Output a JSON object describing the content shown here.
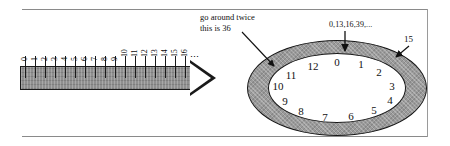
{
  "figure": {
    "number_line": {
      "ticks": [
        "0",
        "1",
        "2",
        "3",
        "4",
        "5",
        "6",
        "7",
        "8",
        "9",
        "10",
        "11",
        "12",
        "13",
        "14",
        "15",
        "16"
      ],
      "continuation": "⋮",
      "arrow_direction": "right"
    },
    "clock": {
      "numbers": [
        "0",
        "1",
        "2",
        "3",
        "4",
        "5",
        "6",
        "7",
        "8",
        "9",
        "10",
        "11",
        "12"
      ],
      "modulus": 13
    },
    "annotations": {
      "go_around_twice": "go around twice\nthis is 36",
      "go_around_twice_line1": "go around twice",
      "go_around_twice_line2": "this is 36",
      "sequence": "0,13,16,39,...",
      "fifteen": "15"
    },
    "colors": {
      "shaft_fill": "#8f8f8f",
      "ring_fill": "#9a9a9a",
      "stroke": "#161616",
      "frame_rule": "#8a8a8a",
      "page_background": "#ffffff"
    }
  }
}
